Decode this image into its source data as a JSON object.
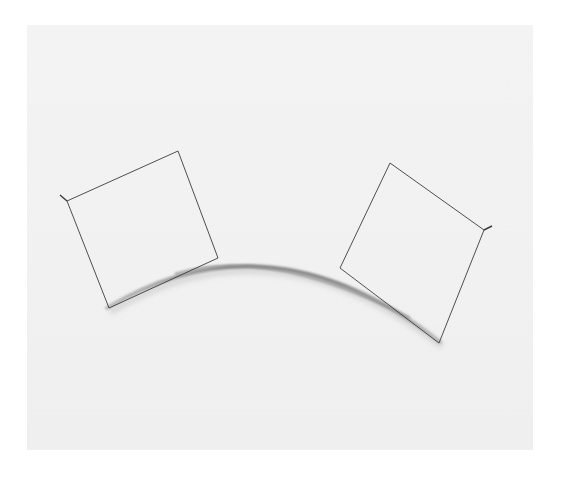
{
  "artwork": {
    "description": "Two wire-frame squares joined by a curved grey arc on a white wall",
    "colors": {
      "background": "#ffffff",
      "wall": "#f2f2f2",
      "wire": "#3a3a3a",
      "arc": "#8a8a8a",
      "arc_shadow": "#c8c8c8"
    }
  }
}
